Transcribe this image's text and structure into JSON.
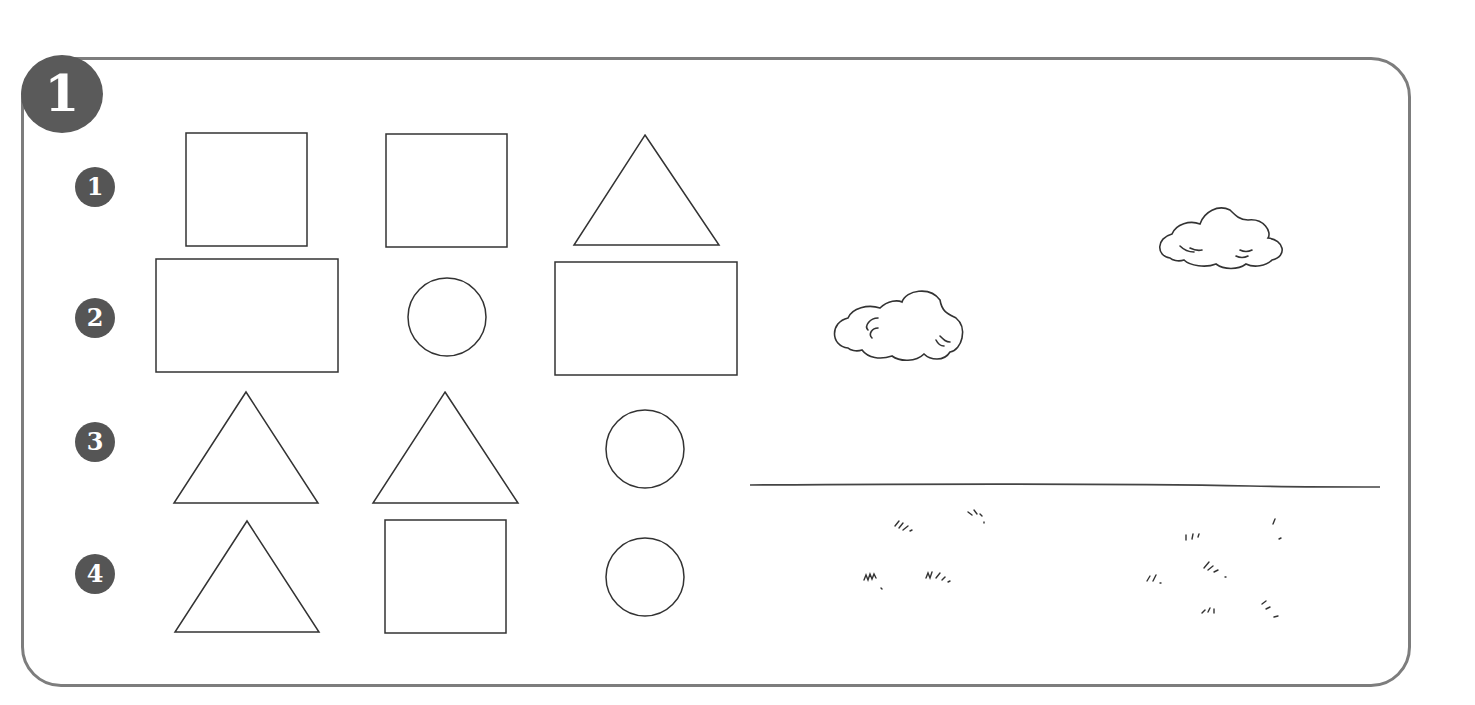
{
  "section": {
    "number": "1"
  },
  "rows": [
    {
      "label": "1",
      "shapes": [
        "square",
        "square",
        "triangle"
      ]
    },
    {
      "label": "2",
      "shapes": [
        "rectangle",
        "circle",
        "rectangle"
      ]
    },
    {
      "label": "3",
      "shapes": [
        "triangle",
        "triangle",
        "circle"
      ]
    },
    {
      "label": "4",
      "shapes": [
        "triangle",
        "square",
        "circle"
      ]
    }
  ],
  "scene": {
    "elements": [
      "cloud-left",
      "cloud-right",
      "ground-line",
      "grass-tufts"
    ]
  },
  "colors": {
    "frame": "#7d7d7d",
    "badge": "#555555",
    "stroke": "#333333"
  }
}
